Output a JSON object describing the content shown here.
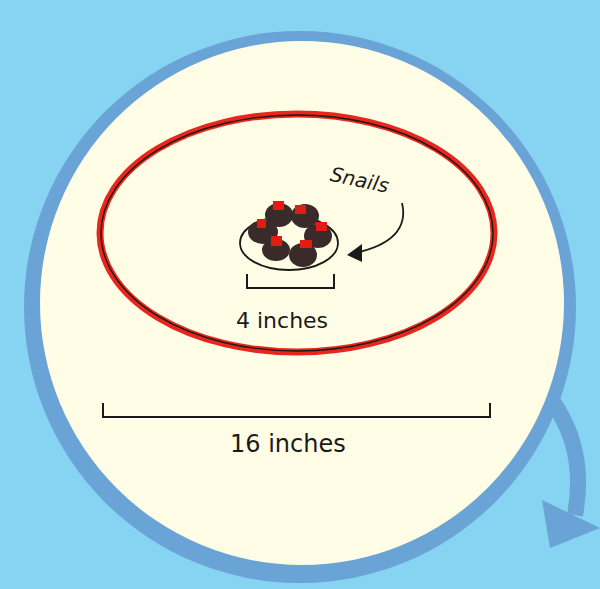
{
  "diagram": {
    "callout_label": "Snails",
    "small_dimension_label": "4 inches",
    "large_dimension_label": "16 inches",
    "snail_count": 6
  },
  "colors": {
    "background": "#86d3f2",
    "ring": "#6aa3d6",
    "plate_surface": "#fffde6",
    "rim_red": "#e8261c",
    "ink": "#1a1a1a",
    "snail_body": "#3a2a2a",
    "snail_accent": "#e31b13"
  }
}
